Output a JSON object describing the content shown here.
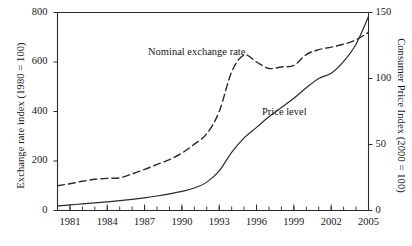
{
  "chart_data": {
    "type": "line",
    "title": "",
    "xlabel": "",
    "ylabel": "Exchange rate index (1980 = 100)",
    "y2label": "Consumer Price Index (2000 = 100)",
    "xlim": [
      1980,
      2005
    ],
    "ylim": [
      800,
      0
    ],
    "y2lim": [
      0,
      150
    ],
    "y_inverted": true,
    "grid": false,
    "legend": "inline-annotations",
    "x_tick_labels": [
      "1981",
      "1984",
      "1987",
      "1990",
      "1993",
      "1996",
      "1999",
      "2002",
      "2005"
    ],
    "x_tick_values": [
      1981,
      1984,
      1987,
      1990,
      1993,
      1996,
      1999,
      2002,
      2005
    ],
    "x_minor_ticks": [
      1980,
      1981,
      1982,
      1983,
      1984,
      1985,
      1986,
      1987,
      1988,
      1989,
      1990,
      1991,
      1992,
      1993,
      1994,
      1995,
      1996,
      1997,
      1998,
      1999,
      2000,
      2001,
      2002,
      2003,
      2004,
      2005
    ],
    "y_tick_labels": [
      "0",
      "200",
      "400",
      "600",
      "800"
    ],
    "y_tick_values": [
      0,
      200,
      400,
      600,
      800
    ],
    "y2_tick_labels": [
      "0",
      "50",
      "100",
      "150"
    ],
    "y2_tick_values": [
      0,
      50,
      100,
      150
    ],
    "annotations": [
      {
        "text": "Nominal exchange rate",
        "x": 1988.5,
        "y": 150
      },
      {
        "text": "Price level",
        "x": 1998.0,
        "y": 70
      }
    ],
    "series": [
      {
        "name": "Nominal exchange rate",
        "axis": "left",
        "style": "dashed",
        "color": "#2b2b2b",
        "x": [
          1980,
          1981,
          1982,
          1983,
          1984,
          1985,
          1986,
          1987,
          1988,
          1989,
          1990,
          1991,
          1992,
          1993,
          1994,
          1995,
          1996,
          1997,
          1998,
          1999,
          2000,
          2001,
          2002,
          2003,
          2004,
          2005
        ],
        "values": [
          100,
          108,
          118,
          126,
          130,
          132,
          148,
          166,
          186,
          206,
          232,
          268,
          310,
          400,
          560,
          628,
          600,
          574,
          580,
          586,
          630,
          650,
          660,
          672,
          690,
          720
        ]
      },
      {
        "name": "Price level",
        "axis": "right",
        "style": "solid",
        "color": "#2b2b2b",
        "x": [
          1980,
          1981,
          1982,
          1983,
          1984,
          1985,
          1986,
          1987,
          1988,
          1989,
          1990,
          1991,
          1992,
          1993,
          1994,
          1995,
          1996,
          1997,
          1998,
          1999,
          2000,
          2001,
          2002,
          2003,
          2004,
          2005
        ],
        "values": [
          3.5,
          4.2,
          5.0,
          5.8,
          6.6,
          7.5,
          8.5,
          9.6,
          11.0,
          12.6,
          14.5,
          17.0,
          21.5,
          30.0,
          44.0,
          55.0,
          63.0,
          71.0,
          78.0,
          85.0,
          93.0,
          100.0,
          104.0,
          113.0,
          126.0,
          147.0
        ]
      }
    ]
  }
}
